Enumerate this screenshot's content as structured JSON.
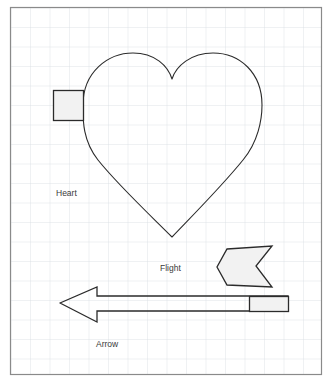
{
  "canvas": {
    "width": 332,
    "height": 386,
    "background_color": "#ffffff",
    "border_color": "#8a8a8a",
    "frame": {
      "x": 10,
      "y": 7,
      "width": 312,
      "height": 368
    }
  },
  "grid": {
    "visible": true,
    "cell_size": 19.5,
    "line_color": "#d9dde3",
    "line_width": 0.8
  },
  "style": {
    "stroke_color": "#2b2b2b",
    "shape_fill": "#f2f2f2",
    "outline_fill": "none",
    "label_color": "#3a3a3a",
    "label_font_size": 8.5
  },
  "shapes": [
    {
      "id": "heart",
      "name": "Heart",
      "label": "Heart",
      "label_position": {
        "x": 56,
        "y": 196
      },
      "fill": "none",
      "stroke": "#2b2b2b",
      "stroke_width": 1.1,
      "path": "M 172 237 C 150 215 118 185 98 160 C 82 140 83 118 83 105 C 83 72 108 53 133 53 C 155 53 168 66 172 79 C 176 66 191 53 213 53 C 240 53 262 73 262 105 C 262 120 258 142 243 160 C 222 186 193 215 172 237 Z"
    },
    {
      "id": "heart-handle",
      "name": "Heart handle rectangle",
      "label": null,
      "fill": "#f2f2f2",
      "stroke": "#2b2b2b",
      "stroke_width": 1.3,
      "rect": {
        "x": 53,
        "y": 90,
        "width": 30,
        "height": 30
      }
    },
    {
      "id": "flight",
      "name": "Flight",
      "label": "Flight",
      "label_position": {
        "x": 160,
        "y": 271
      },
      "fill": "#f2f2f2",
      "stroke": "#2b2b2b",
      "stroke_width": 1.3,
      "points": "227,249 272,246 256,266 272,287 227,285 217,267"
    },
    {
      "id": "arrow",
      "name": "Arrow",
      "label": "Arrow",
      "label_position": {
        "x": 96,
        "y": 347
      },
      "fill": "none",
      "stroke": "#2b2b2b",
      "stroke_width": 1.3,
      "points": "60,303 97,287 97,296 288,296 288,311 97,311 97,322"
    },
    {
      "id": "arrow-tail",
      "name": "Arrow tail rectangle",
      "label": null,
      "fill": "#f2f2f2",
      "stroke": "#2b2b2b",
      "stroke_width": 1.3,
      "rect": {
        "x": 249,
        "y": 296,
        "width": 39,
        "height": 15
      }
    }
  ],
  "labels": [
    {
      "id": "label-heart",
      "text": "Heart",
      "x": 56,
      "y": 196
    },
    {
      "id": "label-flight",
      "text": "Flight",
      "x": 160,
      "y": 271
    },
    {
      "id": "label-arrow",
      "text": "Arrow",
      "x": 96,
      "y": 347
    }
  ]
}
